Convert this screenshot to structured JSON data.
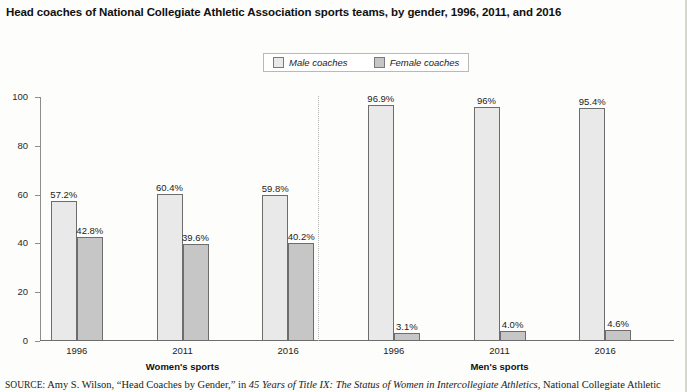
{
  "title": "Head coaches of National Collegiate Athletic Association sports teams, by gender, 1996, 2011, and 2016",
  "legend": {
    "male_label": "Male coaches",
    "female_label": "Female coaches"
  },
  "group_labels": {
    "women": "Women's sports",
    "men": "Men's sports"
  },
  "source": {
    "prefix": "SOURCE:",
    "author": " Amy S. Wilson, “Head Coaches by Gender,” in ",
    "italic_title": "45 Years of Title IX: The Status of Women in Intercollegiate Athletics",
    "suffix": ", National Collegiate Athletic"
  },
  "colors": {
    "male_fill": "#e9e9e9",
    "female_fill": "#c6c6c6",
    "bar_border": "#6d6d6d",
    "axis": "#8d8d8d",
    "divider": "#b5b5b5",
    "background": "#fdfdfb"
  },
  "chart_data": {
    "type": "bar",
    "title": "Head coaches of National Collegiate Athletic Association sports teams, by gender, 1996, 2011, and 2016",
    "xlabel": "",
    "ylabel": "",
    "ylim": [
      0,
      100
    ],
    "yticks": [
      0,
      20,
      40,
      60,
      80,
      100
    ],
    "ytick_labels": [
      "0",
      "20",
      "40",
      "60",
      "80",
      "100"
    ],
    "grid": false,
    "legend_position": "top-center",
    "categories": [
      "1996",
      "2011",
      "2016",
      "1996",
      "2011",
      "2016"
    ],
    "panels": [
      {
        "name": "Women's sports",
        "categories": [
          "1996",
          "2011",
          "2016"
        ]
      },
      {
        "name": "Men's sports",
        "categories": [
          "1996",
          "2011",
          "2016"
        ]
      }
    ],
    "series": [
      {
        "name": "Male coaches",
        "values": [
          57.2,
          60.4,
          59.8,
          96.9,
          96.0,
          95.4
        ],
        "labels": [
          "57.2%",
          "60.4%",
          "59.8%",
          "96.9%",
          "96%",
          "95.4%"
        ]
      },
      {
        "name": "Female coaches",
        "values": [
          42.8,
          39.6,
          40.2,
          3.1,
          4.0,
          4.6
        ],
        "labels": [
          "42.8%",
          "39.6%",
          "40.2%",
          "3.1%",
          "4.0%",
          "4.6%"
        ]
      }
    ],
    "annotations": [
      "dotted vertical divider separating Women's sports from Men's sports"
    ]
  }
}
